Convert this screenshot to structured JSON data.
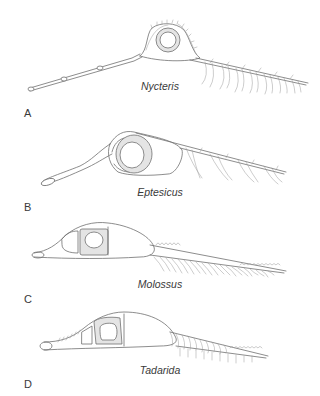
{
  "figure": {
    "panels": [
      {
        "letter": "A",
        "species": "Nycteris"
      },
      {
        "letter": "B",
        "species": "Eptesicus"
      },
      {
        "letter": "C",
        "species": "Molossus"
      },
      {
        "letter": "D",
        "species": "Tadarida"
      }
    ]
  },
  "colors": {
    "line": "#707070",
    "shade": "#e4e4e4",
    "text": "#3a3a3a",
    "background": "#ffffff"
  }
}
